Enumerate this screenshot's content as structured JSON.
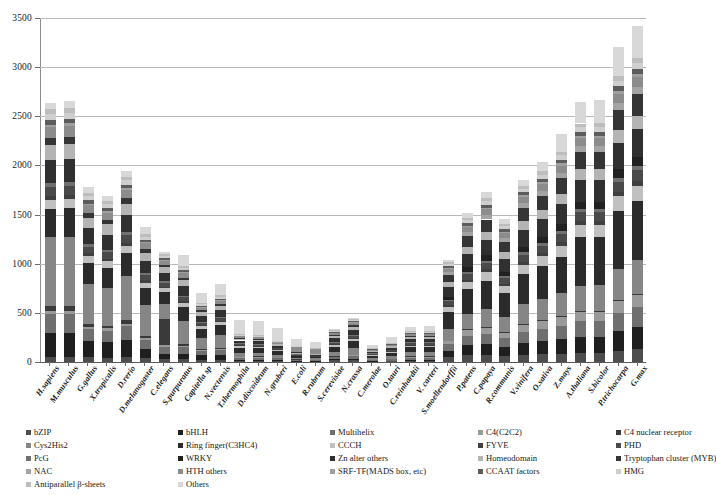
{
  "chart_data": {
    "type": "bar",
    "subtype": "stacked-bar",
    "title": "",
    "xlabel": "",
    "ylabel": "",
    "ylim": [
      0,
      3500
    ],
    "yticks": [
      0,
      500,
      1000,
      1500,
      2000,
      2500,
      3000,
      3500
    ],
    "grid": "horizontal",
    "legend_position": "bottom",
    "categories": [
      "H.sapiens",
      "M.musculus",
      "G.gallus",
      "X.tropicalis",
      "D.rerio",
      "D.melanogaster",
      "C.elegans",
      "S.purpuratus",
      "Capitella sp",
      "N.vectensis",
      "T.thermophila",
      "D.discoideum",
      "N.gruberi",
      "E.coli",
      "R.rubrum",
      "S.cerevisiae",
      "N.crassa",
      "C.merolae",
      "O.tauri",
      "C.reinhardtii",
      "V. carteri",
      "S.moellendorffii",
      "P.patens",
      "C.papaya",
      "R.communis",
      "V.vinifera",
      "O.sativa",
      "Z.mays",
      "A.thaliana",
      "S.bicolor",
      "P.trichocarpa",
      "G.max"
    ],
    "totals": [
      2640,
      2655,
      1780,
      1690,
      1945,
      1370,
      1115,
      1090,
      700,
      790,
      430,
      420,
      345,
      230,
      205,
      335,
      450,
      170,
      250,
      355,
      370,
      1035,
      1520,
      1725,
      1460,
      1850,
      2040,
      2325,
      2650,
      2665,
      3205,
      3420
    ],
    "series": [
      {
        "name": "bZIP",
        "color": "#4d4d4d",
        "values": [
          55,
          55,
          50,
          45,
          50,
          35,
          30,
          30,
          25,
          25,
          12,
          12,
          10,
          6,
          5,
          20,
          22,
          6,
          8,
          12,
          13,
          60,
          85,
          75,
          70,
          80,
          90,
          100,
          90,
          92,
          115,
          150
        ]
      },
      {
        "name": "bHLH",
        "color": "#1f1f1f",
        "values": [
          240,
          245,
          170,
          160,
          185,
          90,
          55,
          50,
          45,
          45,
          10,
          10,
          8,
          4,
          3,
          8,
          12,
          4,
          6,
          10,
          11,
          65,
          110,
          125,
          105,
          135,
          155,
          180,
          165,
          170,
          215,
          245
        ]
      },
      {
        "name": "Multihelix",
        "color": "#6f6f6f",
        "values": [
          195,
          195,
          130,
          125,
          150,
          85,
          70,
          70,
          45,
          50,
          25,
          25,
          20,
          14,
          12,
          25,
          32,
          10,
          16,
          22,
          24,
          75,
          110,
          120,
          100,
          130,
          145,
          165,
          160,
          165,
          195,
          215
        ]
      },
      {
        "name": "C4(C2C2)",
        "color": "#9a9a9a",
        "values": [
          30,
          30,
          25,
          22,
          26,
          16,
          14,
          14,
          10,
          11,
          6,
          6,
          5,
          3,
          3,
          6,
          8,
          3,
          4,
          6,
          6,
          40,
          65,
          75,
          62,
          80,
          92,
          105,
          96,
          98,
          120,
          135
        ]
      },
      {
        "name": "C4 nuclear receptor",
        "color": "#3a3a3a",
        "values": [
          48,
          48,
          30,
          28,
          34,
          20,
          270,
          18,
          10,
          12,
          3,
          3,
          2,
          1,
          1,
          3,
          4,
          1,
          2,
          3,
          3,
          5,
          8,
          9,
          7,
          9,
          10,
          12,
          10,
          11,
          14,
          16
        ]
      },
      {
        "name": "Cys2His2",
        "color": "#868686",
        "values": [
          700,
          710,
          420,
          395,
          470,
          290,
          150,
          230,
          110,
          130,
          40,
          38,
          30,
          14,
          12,
          50,
          68,
          16,
          26,
          40,
          42,
          130,
          180,
          205,
          175,
          220,
          250,
          285,
          260,
          265,
          330,
          375
        ]
      },
      {
        "name": "Ring finger(C3HC4)",
        "color": "#2b2b2b",
        "values": [
          290,
          295,
          230,
          215,
          250,
          160,
          120,
          140,
          90,
          100,
          50,
          48,
          38,
          18,
          16,
          55,
          70,
          22,
          32,
          48,
          50,
          195,
          285,
          320,
          270,
          345,
          385,
          440,
          500,
          510,
          615,
          660
        ]
      },
      {
        "name": "CCCH",
        "color": "#c0c0c0",
        "values": [
          90,
          92,
          70,
          66,
          78,
          52,
          40,
          42,
          28,
          32,
          16,
          15,
          12,
          7,
          6,
          20,
          26,
          8,
          12,
          18,
          19,
          60,
          88,
          98,
          84,
          105,
          118,
          135,
          122,
          126,
          152,
          168
        ]
      },
      {
        "name": "FYVE",
        "color": "#3f3f3f",
        "values": [
          40,
          40,
          30,
          28,
          33,
          22,
          18,
          18,
          12,
          14,
          7,
          7,
          5,
          3,
          2,
          9,
          11,
          3,
          5,
          8,
          8,
          18,
          26,
          29,
          25,
          31,
          35,
          40,
          36,
          37,
          45,
          50
        ]
      },
      {
        "name": "PHD",
        "color": "#4a4a4a",
        "values": [
          95,
          96,
          72,
          68,
          80,
          52,
          40,
          42,
          26,
          30,
          14,
          13,
          10,
          5,
          4,
          20,
          26,
          7,
          11,
          16,
          17,
          45,
          66,
          74,
          63,
          79,
          88,
          101,
          91,
          94,
          113,
          126
        ]
      },
      {
        "name": "PcG",
        "color": "#707070",
        "values": [
          38,
          38,
          28,
          26,
          31,
          20,
          16,
          16,
          10,
          12,
          6,
          5,
          4,
          2,
          2,
          8,
          10,
          3,
          4,
          6,
          7,
          16,
          24,
          27,
          23,
          29,
          32,
          37,
          33,
          34,
          41,
          46
        ]
      },
      {
        "name": "WRKY",
        "color": "#212121",
        "values": [
          0,
          0,
          0,
          0,
          0,
          0,
          0,
          0,
          0,
          0,
          0,
          0,
          0,
          0,
          0,
          0,
          0,
          0,
          0,
          0,
          0,
          35,
          52,
          58,
          50,
          62,
          70,
          80,
          72,
          74,
          89,
          99
        ]
      },
      {
        "name": "Zn alter others",
        "color": "#303030",
        "values": [
          230,
          232,
          165,
          155,
          182,
          110,
          85,
          92,
          58,
          66,
          30,
          28,
          22,
          11,
          9,
          38,
          50,
          14,
          21,
          32,
          34,
          110,
          160,
          180,
          154,
          192,
          215,
          246,
          222,
          228,
          275,
          306
        ]
      },
      {
        "name": "Homeodomain",
        "color": "#b4b4b4",
        "values": [
          160,
          162,
          115,
          108,
          126,
          78,
          58,
          62,
          40,
          46,
          20,
          19,
          15,
          8,
          6,
          26,
          34,
          10,
          15,
          22,
          23,
          55,
          80,
          90,
          77,
          96,
          108,
          123,
          111,
          114,
          137,
          152
        ]
      },
      {
        "name": "Tryptophan cluster (MYB)",
        "color": "#353535",
        "values": [
          70,
          70,
          52,
          48,
          57,
          34,
          26,
          28,
          18,
          20,
          9,
          8,
          7,
          3,
          3,
          12,
          15,
          4,
          7,
          10,
          11,
          85,
          125,
          140,
          120,
          150,
          168,
          192,
          173,
          178,
          214,
          238
        ]
      },
      {
        "name": "NAC",
        "color": "#a3a3a3",
        "values": [
          0,
          0,
          0,
          0,
          0,
          0,
          0,
          0,
          0,
          0,
          0,
          0,
          0,
          0,
          0,
          0,
          0,
          0,
          0,
          0,
          0,
          30,
          44,
          50,
          42,
          53,
          59,
          68,
          61,
          63,
          75,
          84
        ]
      },
      {
        "name": "HTH others",
        "color": "#8c8c8c",
        "values": [
          110,
          112,
          80,
          75,
          88,
          54,
          40,
          44,
          28,
          32,
          14,
          13,
          11,
          55,
          48,
          22,
          28,
          7,
          10,
          16,
          17,
          40,
          58,
          65,
          56,
          70,
          78,
          89,
          80,
          82,
          99,
          110
        ]
      },
      {
        "name": "SRF-TF(MADS box, etc)",
        "color": "#9f9f9f",
        "values": [
          25,
          25,
          18,
          17,
          20,
          12,
          9,
          10,
          6,
          7,
          3,
          3,
          2,
          1,
          1,
          4,
          5,
          2,
          2,
          4,
          4,
          12,
          18,
          20,
          17,
          21,
          24,
          27,
          24,
          25,
          30,
          34
        ]
      },
      {
        "name": "CCAAT factors",
        "color": "#5c5c5c",
        "values": [
          45,
          45,
          33,
          31,
          36,
          22,
          17,
          18,
          11,
          13,
          6,
          5,
          4,
          2,
          2,
          8,
          10,
          3,
          4,
          7,
          7,
          20,
          29,
          33,
          28,
          35,
          39,
          45,
          40,
          42,
          50,
          56
        ]
      },
      {
        "name": "HMG",
        "color": "#cfcfcf",
        "values": [
          60,
          60,
          44,
          41,
          48,
          30,
          22,
          24,
          15,
          17,
          7,
          7,
          6,
          3,
          2,
          10,
          13,
          4,
          6,
          9,
          9,
          24,
          35,
          40,
          34,
          42,
          47,
          54,
          49,
          50,
          60,
          67
        ]
      },
      {
        "name": "Antiparallel β-sheets",
        "color": "#bdbdbd",
        "values": [
          50,
          50,
          36,
          34,
          40,
          24,
          18,
          20,
          12,
          14,
          6,
          6,
          5,
          2,
          2,
          9,
          11,
          3,
          5,
          7,
          8,
          20,
          29,
          33,
          28,
          35,
          39,
          45,
          40,
          41,
          50,
          55
        ]
      },
      {
        "name": "Others",
        "color": "#d8d8d8",
        "values": [
          69,
          74,
          62,
          53,
          61,
          64,
          17,
          112,
          101,
          113,
          146,
          146,
          129,
          68,
          66,
          12,
          10,
          30,
          57,
          39,
          57,
          20,
          57,
          67,
          60,
          61,
          117,
          221,
          224,
          241,
          306,
          358
        ]
      }
    ]
  },
  "legend": {
    "columns": [
      [
        {
          "label": "bZIP",
          "color": "#4d4d4d"
        },
        {
          "label": "Cys2His2",
          "color": "#868686"
        },
        {
          "label": "PcG",
          "color": "#707070"
        },
        {
          "label": "NAC",
          "color": "#a3a3a3"
        },
        {
          "label": "Antiparallel β-sheets",
          "color": "#bdbdbd"
        }
      ],
      [
        {
          "label": "bHLH",
          "color": "#1f1f1f"
        },
        {
          "label": "Ring finger(C3HC4)",
          "color": "#2b2b2b"
        },
        {
          "label": "WRKY",
          "color": "#212121"
        },
        {
          "label": "HTH others",
          "color": "#8c8c8c"
        },
        {
          "label": "Others",
          "color": "#d8d8d8"
        }
      ],
      [
        {
          "label": "Multihelix",
          "color": "#6f6f6f"
        },
        {
          "label": "CCCH",
          "color": "#c0c0c0"
        },
        {
          "label": "Zn alter others",
          "color": "#303030"
        },
        {
          "label": "SRF-TF(MADS box, etc)",
          "color": "#9f9f9f"
        }
      ],
      [
        {
          "label": "C4(C2C2)",
          "color": "#9a9a9a"
        },
        {
          "label": "FYVE",
          "color": "#3f3f3f"
        },
        {
          "label": "Homeodomain",
          "color": "#b4b4b4"
        },
        {
          "label": "CCAAT factors",
          "color": "#5c5c5c"
        }
      ],
      [
        {
          "label": "C4 nuclear receptor",
          "color": "#3a3a3a"
        },
        {
          "label": "PHD",
          "color": "#4a4a4a"
        },
        {
          "label": "Tryptophan cluster (MYB)",
          "color": "#353535"
        },
        {
          "label": "HMG",
          "color": "#cfcfcf"
        }
      ]
    ]
  },
  "axis": {
    "gridline_color": "#b9b9b9",
    "axis_color": "#5a5a5a"
  }
}
